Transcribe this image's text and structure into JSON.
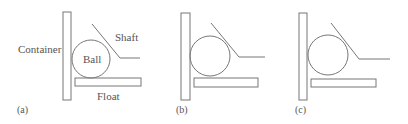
{
  "panels": [
    {
      "id": "a",
      "caption": "(a)",
      "labels": {
        "container": "Container",
        "ball": "Ball",
        "shaft": "Shaft",
        "float": "Float"
      }
    },
    {
      "id": "b",
      "caption": "(b)"
    },
    {
      "id": "c",
      "caption": "(c)"
    }
  ],
  "colors": {
    "stroke": "#777777",
    "text": "#555555",
    "background": "#ffffff"
  }
}
